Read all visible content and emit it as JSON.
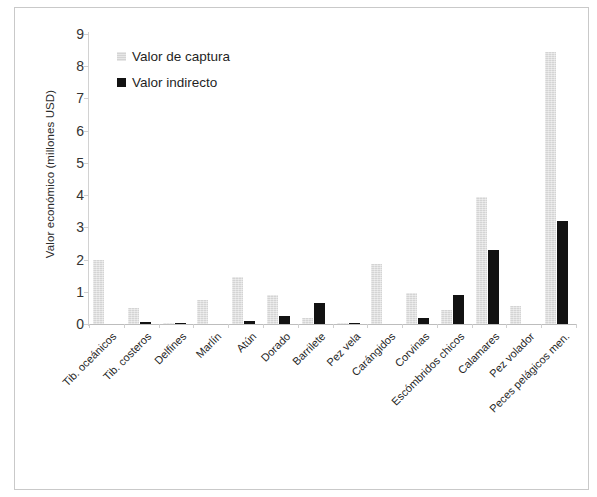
{
  "chart_data": {
    "type": "bar",
    "title": "",
    "xlabel": "",
    "ylabel": "Valor económico (millones USD)",
    "ylim": [
      0,
      9
    ],
    "ytick_values": [
      0,
      1,
      2,
      3,
      4,
      5,
      6,
      7,
      8,
      9
    ],
    "ytick_labels": [
      "0",
      "1",
      "2",
      "3",
      "4",
      "5",
      "6",
      "7",
      "8",
      "9"
    ],
    "grid": false,
    "legend_position": "upper-left-inside",
    "categories": [
      "Tib. oceánicos",
      "Tib. costeros",
      "Delfines",
      "Marlín",
      "Atún",
      "Dorado",
      "Barrilete",
      "Pez vela",
      "Carángidos",
      "Corvinas",
      "Escómbridos chicos",
      "Calamares",
      "Pez volador",
      "Peces pelágicos men."
    ],
    "series": [
      {
        "name": "Valor de captura",
        "color": "#d4d4d4",
        "values": [
          2.0,
          0.5,
          0.02,
          0.75,
          1.45,
          0.9,
          0.2,
          0.02,
          1.85,
          0.95,
          0.45,
          3.95,
          0.55,
          8.45
        ]
      },
      {
        "name": "Valor indirecto",
        "color": "#121212",
        "values": [
          0.0,
          0.05,
          0.03,
          0.0,
          0.1,
          0.25,
          0.65,
          0.02,
          0.0,
          0.2,
          0.9,
          2.3,
          0.0,
          3.2
        ]
      }
    ]
  }
}
